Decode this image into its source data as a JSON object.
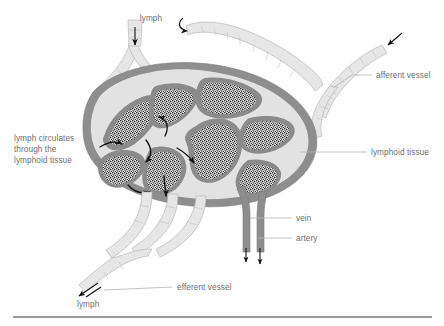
{
  "figure": {
    "colors": {
      "capsule": "#8e8e8e",
      "sinus": "#e2e2e2",
      "lymphoid_tissue_stipple": "#3a3a3a",
      "vessel_light": "#e6e6e6",
      "vessel_dark": "#8e8e8e",
      "label_text": "#6e6e6e",
      "leader_line": "#b4b4b4",
      "arrow": "#111111",
      "base_rule": "#9a9a9a"
    },
    "labels": {
      "lymph_top": "lymph",
      "lymph_bottom": "lymph",
      "afferent_vessel": "afferent vessel",
      "lymphoid_tissue": "lymphoid tissue",
      "vein": "vein",
      "artery": "artery",
      "efferent_vessel": "efferent vessel",
      "circulation_note_line1": "lymph circulates",
      "circulation_note_line2": "through the",
      "circulation_note_line3": "lymphoid tissue"
    },
    "parts": {
      "node_body": "lymph-node",
      "afferent_count": 3,
      "efferent_count": 1,
      "flow_arrow_count": 6,
      "lobule_count": 8
    }
  }
}
